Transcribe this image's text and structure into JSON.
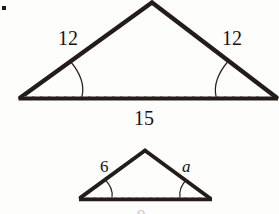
{
  "figure": {
    "kind": "geometry-figure",
    "background_color": "#fdfdfc",
    "ink_color": "#231c19",
    "bullet_marker": "▪",
    "clipped_caption": "9",
    "triangles": [
      {
        "name": "large-triangle",
        "labels": {
          "left_side": "12",
          "right_side": "12",
          "base": "15"
        },
        "angle_marks": 2
      },
      {
        "name": "small-triangle",
        "labels": {
          "left_side": "6",
          "right_side": "a"
        },
        "angle_marks": 2
      }
    ]
  },
  "labels": {
    "large_left_side": "12",
    "large_right_side": "12",
    "large_base": "15",
    "small_left_side": "6",
    "small_right_side": "a"
  }
}
